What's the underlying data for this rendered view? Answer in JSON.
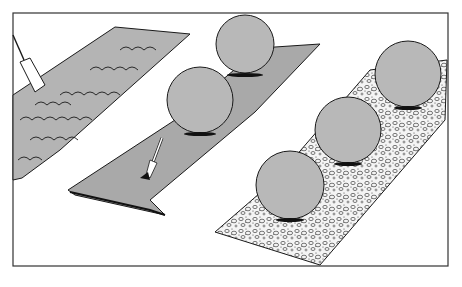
{
  "illustration": {
    "subject": "three garden beds: tilled soil, landscape fabric, gravel mulch with shrubs",
    "colors": {
      "background": "#ffffff",
      "frame": "#333333",
      "soil": "#b4b4b4",
      "fabric": "#a9a9a9",
      "shrub": "#b8b8b8",
      "line": "#1a1a1a",
      "shadow": "#111111"
    },
    "panels": [
      {
        "name": "tilled-bed",
        "tool": "spade"
      },
      {
        "name": "fabric-bed",
        "tool": "trowel",
        "shrubs": 2
      },
      {
        "name": "gravel-bed",
        "shrubs": 3
      }
    ]
  }
}
